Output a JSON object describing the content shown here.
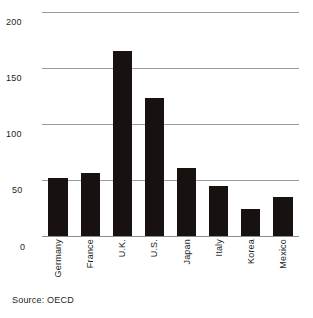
{
  "chart_data": {
    "type": "bar",
    "title": "",
    "subtitle": "",
    "xlabel": "",
    "ylabel": "",
    "categories": [
      "Germany",
      "France",
      "U.K.",
      "U.S.",
      "Japan",
      "Italy",
      "Korea",
      "Mexico"
    ],
    "values": [
      52,
      56,
      165,
      123,
      61,
      45,
      24,
      35
    ],
    "ylim": [
      0,
      200
    ],
    "yticks": [
      0,
      50,
      100,
      150,
      200
    ],
    "ytick_labels": [
      "0",
      "50",
      "100",
      "150",
      "200"
    ],
    "grid": true,
    "grid_axis": "y",
    "legend": "none",
    "bar_color": "#17120f",
    "grid_color": "#9a9a9a",
    "text_color": "#231f20",
    "background_color": "#ffffff",
    "xtick_rotation": 90,
    "source_note": "Source: OECD"
  },
  "axis": {
    "yticks": [
      {
        "label": "200",
        "value": 200
      },
      {
        "label": "150",
        "value": 150
      },
      {
        "label": "100",
        "value": 100
      },
      {
        "label": "50",
        "value": 50
      },
      {
        "label": "0",
        "value": 0
      }
    ]
  },
  "footer": {
    "source": "Source: OECD"
  }
}
